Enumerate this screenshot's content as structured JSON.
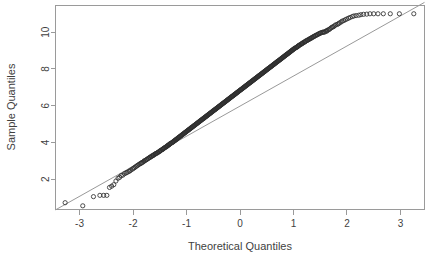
{
  "chart_data": {
    "type": "scatter",
    "title": "",
    "subtitle": "",
    "xlabel": "Theoretical Quantiles",
    "ylabel": "Sample Quantiles",
    "xlim": [
      -3.45,
      3.45
    ],
    "ylim": [
      0.35,
      11.45
    ],
    "xticks": [
      -3,
      -2,
      -1,
      0,
      1,
      2,
      3
    ],
    "xticklabels": [
      "-3",
      "-2",
      "-1",
      "0",
      "1",
      "2",
      "3"
    ],
    "yticks": [
      2,
      4,
      6,
      8,
      10
    ],
    "yticklabels": [
      "2",
      "4",
      "6",
      "8",
      "10"
    ],
    "grid": false,
    "legend": null,
    "marker": "open-circle",
    "marker_size": 2.1,
    "point_color": "#2e2e2e",
    "reference_line": {
      "name": "qqline",
      "color": "#8d8d8d",
      "x": [
        -3.45,
        3.45
      ],
      "y": [
        0.33,
        11.62
      ]
    },
    "annotations": [],
    "series": [
      {
        "name": "Sample Quantiles",
        "x": [
          -3.27,
          -2.94,
          -2.74,
          -2.62,
          -2.55,
          -2.49,
          -2.44,
          -2.4,
          -2.36,
          -2.32,
          -2.28,
          -2.25,
          -2.22,
          -2.19,
          -2.16,
          -2.13,
          -2.11,
          -2.08,
          -2.06,
          -2.04,
          -2.01,
          -1.99,
          -1.97,
          -1.95,
          -1.93,
          -1.91,
          -1.89,
          -1.87,
          -1.85,
          -1.84,
          -1.82,
          -1.8,
          -1.79,
          -1.77,
          -1.75,
          -1.74,
          -1.72,
          -1.71,
          -1.69,
          -1.68,
          -1.66,
          -1.65,
          -1.63,
          -1.62,
          -1.61,
          -1.59,
          -1.58,
          -1.57,
          -1.55,
          -1.54,
          -1.53,
          -1.51,
          -1.5,
          -1.49,
          -1.48,
          -1.46,
          -1.45,
          -1.44,
          -1.43,
          -1.42,
          -1.41,
          -1.39,
          -1.38,
          -1.37,
          -1.36,
          -1.35,
          -1.34,
          -1.33,
          -1.32,
          -1.31,
          -1.3,
          -1.29,
          -1.27,
          -1.26,
          -1.25,
          -1.24,
          -1.23,
          -1.22,
          -1.21,
          -1.2,
          -1.19,
          -1.18,
          -1.17,
          -1.16,
          -1.15,
          -1.14,
          -1.13,
          -1.12,
          -1.11,
          -1.1,
          -1.09,
          -1.08,
          -1.07,
          -1.06,
          -1.05,
          -1.04,
          -1.03,
          -1.02,
          -1.01,
          -1.0,
          -0.99,
          -0.98,
          -0.97,
          -0.96,
          -0.95,
          -0.94,
          -0.93,
          -0.92,
          -0.91,
          -0.9,
          -0.89,
          -0.88,
          -0.87,
          -0.86,
          -0.85,
          -0.84,
          -0.83,
          -0.82,
          -0.81,
          -0.8,
          -0.79,
          -0.78,
          -0.77,
          -0.76,
          -0.75,
          -0.74,
          -0.73,
          -0.72,
          -0.71,
          -0.7,
          -0.69,
          -0.68,
          -0.67,
          -0.66,
          -0.65,
          -0.64,
          -0.63,
          -0.62,
          -0.61,
          -0.6,
          -0.59,
          -0.58,
          -0.57,
          -0.56,
          -0.55,
          -0.54,
          -0.53,
          -0.52,
          -0.51,
          -0.5,
          -0.49,
          -0.48,
          -0.47,
          -0.46,
          -0.45,
          -0.44,
          -0.43,
          -0.42,
          -0.41,
          -0.4,
          -0.39,
          -0.38,
          -0.37,
          -0.36,
          -0.35,
          -0.34,
          -0.33,
          -0.32,
          -0.31,
          -0.3,
          -0.29,
          -0.28,
          -0.27,
          -0.26,
          -0.25,
          -0.24,
          -0.23,
          -0.22,
          -0.21,
          -0.2,
          -0.19,
          -0.18,
          -0.17,
          -0.16,
          -0.15,
          -0.14,
          -0.13,
          -0.12,
          -0.11,
          -0.1,
          -0.09,
          -0.08,
          -0.07,
          -0.06,
          -0.05,
          -0.04,
          -0.03,
          -0.02,
          -0.01,
          0.0,
          0.01,
          0.02,
          0.03,
          0.04,
          0.05,
          0.06,
          0.07,
          0.08,
          0.09,
          0.1,
          0.11,
          0.12,
          0.13,
          0.14,
          0.15,
          0.16,
          0.17,
          0.18,
          0.19,
          0.2,
          0.21,
          0.22,
          0.23,
          0.24,
          0.25,
          0.26,
          0.27,
          0.28,
          0.29,
          0.3,
          0.31,
          0.32,
          0.33,
          0.34,
          0.35,
          0.36,
          0.37,
          0.38,
          0.39,
          0.4,
          0.41,
          0.42,
          0.43,
          0.44,
          0.45,
          0.46,
          0.47,
          0.48,
          0.49,
          0.5,
          0.51,
          0.52,
          0.53,
          0.54,
          0.55,
          0.56,
          0.57,
          0.58,
          0.59,
          0.6,
          0.61,
          0.62,
          0.63,
          0.64,
          0.65,
          0.66,
          0.67,
          0.68,
          0.69,
          0.7,
          0.71,
          0.72,
          0.73,
          0.74,
          0.75,
          0.76,
          0.77,
          0.78,
          0.79,
          0.8,
          0.81,
          0.82,
          0.83,
          0.84,
          0.85,
          0.86,
          0.87,
          0.88,
          0.89,
          0.9,
          0.91,
          0.92,
          0.93,
          0.94,
          0.95,
          0.96,
          0.97,
          0.98,
          0.99,
          1.0,
          1.01,
          1.02,
          1.03,
          1.05,
          1.06,
          1.07,
          1.08,
          1.09,
          1.1,
          1.11,
          1.12,
          1.14,
          1.15,
          1.16,
          1.17,
          1.18,
          1.2,
          1.21,
          1.22,
          1.23,
          1.25,
          1.26,
          1.27,
          1.29,
          1.3,
          1.31,
          1.33,
          1.34,
          1.35,
          1.37,
          1.38,
          1.39,
          1.41,
          1.42,
          1.44,
          1.45,
          1.47,
          1.48,
          1.5,
          1.51,
          1.53,
          1.55,
          1.56,
          1.58,
          1.6,
          1.62,
          1.63,
          1.65,
          1.67,
          1.69,
          1.71,
          1.73,
          1.75,
          1.77,
          1.79,
          1.82,
          1.84,
          1.86,
          1.89,
          1.91,
          1.94,
          1.97,
          2.0,
          2.03,
          2.06,
          2.1,
          2.13,
          2.17,
          2.22,
          2.26,
          2.31,
          2.37,
          2.43,
          2.5,
          2.58,
          2.68,
          2.81,
          2.98,
          3.25
        ],
        "y": [
          0.72,
          0.55,
          1.05,
          1.12,
          1.12,
          1.12,
          1.55,
          1.62,
          1.7,
          1.9,
          2.05,
          2.1,
          2.2,
          2.22,
          2.3,
          2.34,
          2.37,
          2.42,
          2.45,
          2.5,
          2.55,
          2.6,
          2.63,
          2.68,
          2.72,
          2.76,
          2.8,
          2.84,
          2.86,
          2.9,
          2.92,
          2.96,
          3.0,
          3.02,
          3.06,
          3.08,
          3.12,
          3.14,
          3.18,
          3.2,
          3.22,
          3.26,
          3.28,
          3.3,
          3.33,
          3.36,
          3.38,
          3.4,
          3.42,
          3.45,
          3.47,
          3.5,
          3.52,
          3.55,
          3.57,
          3.6,
          3.62,
          3.64,
          3.67,
          3.69,
          3.71,
          3.74,
          3.76,
          3.78,
          3.81,
          3.83,
          3.85,
          3.87,
          3.89,
          3.92,
          3.94,
          3.96,
          3.99,
          4.01,
          4.03,
          4.06,
          4.08,
          4.1,
          4.12,
          4.15,
          4.17,
          4.19,
          4.21,
          4.24,
          4.26,
          4.28,
          4.3,
          4.33,
          4.35,
          4.37,
          4.39,
          4.42,
          4.44,
          4.46,
          4.48,
          4.51,
          4.53,
          4.55,
          4.57,
          4.6,
          4.62,
          4.64,
          4.66,
          4.69,
          4.71,
          4.73,
          4.75,
          4.78,
          4.8,
          4.82,
          4.84,
          4.86,
          4.89,
          4.91,
          4.93,
          4.95,
          4.98,
          5.0,
          5.02,
          5.04,
          5.07,
          5.09,
          5.11,
          5.13,
          5.16,
          5.18,
          5.2,
          5.22,
          5.25,
          5.27,
          5.29,
          5.31,
          5.33,
          5.36,
          5.38,
          5.4,
          5.42,
          5.45,
          5.47,
          5.49,
          5.51,
          5.54,
          5.56,
          5.58,
          5.6,
          5.63,
          5.65,
          5.67,
          5.69,
          5.72,
          5.74,
          5.76,
          5.78,
          5.8,
          5.83,
          5.85,
          5.87,
          5.89,
          5.92,
          5.94,
          5.96,
          5.98,
          6.01,
          6.03,
          6.05,
          6.07,
          6.1,
          6.12,
          6.14,
          6.16,
          6.18,
          6.21,
          6.23,
          6.25,
          6.27,
          6.3,
          6.32,
          6.34,
          6.36,
          6.39,
          6.41,
          6.43,
          6.45,
          6.48,
          6.5,
          6.52,
          6.54,
          6.56,
          6.59,
          6.61,
          6.63,
          6.65,
          6.68,
          6.7,
          6.72,
          6.74,
          6.77,
          6.79,
          6.81,
          6.83,
          6.86,
          6.88,
          6.9,
          6.92,
          6.94,
          6.97,
          6.99,
          7.01,
          7.03,
          7.06,
          7.08,
          7.1,
          7.12,
          7.15,
          7.17,
          7.19,
          7.21,
          7.24,
          7.26,
          7.28,
          7.3,
          7.32,
          7.35,
          7.37,
          7.39,
          7.41,
          7.44,
          7.46,
          7.48,
          7.5,
          7.53,
          7.55,
          7.57,
          7.59,
          7.62,
          7.64,
          7.66,
          7.68,
          7.7,
          7.73,
          7.75,
          7.77,
          7.79,
          7.82,
          7.84,
          7.86,
          7.88,
          7.91,
          7.93,
          7.95,
          7.97,
          8.0,
          8.02,
          8.04,
          8.06,
          8.08,
          8.11,
          8.13,
          8.15,
          8.17,
          8.2,
          8.22,
          8.24,
          8.26,
          8.29,
          8.31,
          8.33,
          8.35,
          8.38,
          8.4,
          8.42,
          8.44,
          8.46,
          8.49,
          8.51,
          8.53,
          8.55,
          8.58,
          8.6,
          8.62,
          8.64,
          8.67,
          8.69,
          8.71,
          8.73,
          8.76,
          8.78,
          8.8,
          8.82,
          8.84,
          8.87,
          8.89,
          8.91,
          8.93,
          8.96,
          8.98,
          9.0,
          9.02,
          9.05,
          9.07,
          9.09,
          9.11,
          9.14,
          9.16,
          9.18,
          9.2,
          9.22,
          9.25,
          9.27,
          9.29,
          9.31,
          9.34,
          9.36,
          9.38,
          9.4,
          9.43,
          9.45,
          9.47,
          9.49,
          9.52,
          9.54,
          9.56,
          9.58,
          9.6,
          9.63,
          9.65,
          9.67,
          9.69,
          9.72,
          9.74,
          9.76,
          9.78,
          9.81,
          9.83,
          9.85,
          9.87,
          9.9,
          9.92,
          9.94,
          9.96,
          9.98,
          10.0,
          10.0,
          10.0,
          10.05,
          10.05,
          10.1,
          10.12,
          10.15,
          10.2,
          10.25,
          10.28,
          10.3,
          10.35,
          10.4,
          10.42,
          10.46,
          10.5,
          10.55,
          10.6,
          10.63,
          10.68,
          10.72,
          10.76,
          10.8,
          10.85,
          10.88,
          10.9,
          10.92,
          10.95,
          10.97,
          10.98,
          11.0,
          11.0,
          11.0,
          11.0,
          11.0,
          11.0,
          11.0
        ]
      }
    ]
  },
  "plot": {
    "x_axis_title": "Theoretical Quantiles",
    "y_axis_title": "Sample Quantiles"
  }
}
